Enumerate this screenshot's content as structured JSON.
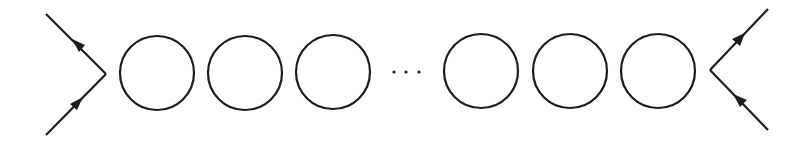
{
  "diagram": {
    "type": "feynman-diagram",
    "stroke_color": "#1c1c1c",
    "background": "#ffffff",
    "left_vertex": {
      "point": [
        106,
        74
      ],
      "lines": [
        {
          "from": [
            46,
            14
          ],
          "to": [
            106,
            74
          ],
          "arrow_at": [
            79,
            46
          ],
          "direction": "toward-start"
        },
        {
          "from": [
            46,
            135
          ],
          "to": [
            106,
            74
          ],
          "arrow_at": [
            76,
            104
          ],
          "direction": "toward-vertex"
        }
      ]
    },
    "right_vertex": {
      "point": [
        710,
        70
      ],
      "lines": [
        {
          "from": [
            710,
            70
          ],
          "to": [
            768,
            9
          ],
          "arrow_at": [
            738,
            40
          ],
          "direction": "toward-end"
        },
        {
          "from": [
            768,
            130
          ],
          "to": [
            710,
            70
          ],
          "arrow_at": [
            740,
            102
          ],
          "direction": "toward-vertex"
        }
      ]
    },
    "bubbles": [
      {
        "cx": 157,
        "cy": 73,
        "r": 37
      },
      {
        "cx": 245,
        "cy": 73,
        "r": 37
      },
      {
        "cx": 333,
        "cy": 72,
        "r": 37
      },
      {
        "cx": 481,
        "cy": 71,
        "r": 37
      },
      {
        "cx": 570,
        "cy": 71,
        "r": 37
      },
      {
        "cx": 658,
        "cy": 71,
        "r": 37
      }
    ],
    "ellipsis": {
      "label": "⋯",
      "dots": [
        [
          394,
          72
        ],
        [
          406,
          72
        ],
        [
          419,
          72
        ]
      ]
    }
  }
}
